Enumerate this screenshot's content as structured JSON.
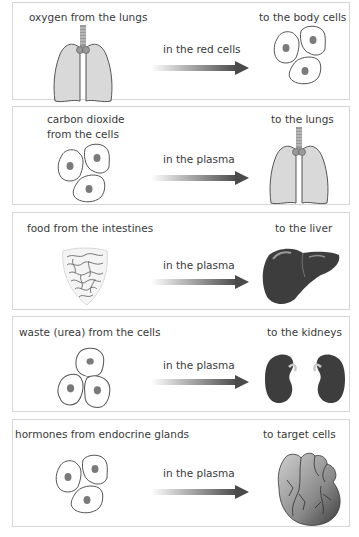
{
  "diagram": {
    "colors": {
      "panel_border": "#d6d6d6",
      "arrow_dark": "#555555",
      "lung_fill": "#d9d9d9",
      "organ_dark": "#3d3d3d",
      "cell_nucleus": "#7a7a7a"
    },
    "rows": [
      {
        "source": "oxygen from the lungs",
        "source_icon": "lungs-icon",
        "carrier": "in the red cells",
        "destination": "to the body cells",
        "destination_icon": "body-cells-icon"
      },
      {
        "source": "carbon dioxide from the cells",
        "source_line1": "carbon dioxide",
        "source_line2": "from the cells",
        "source_icon": "body-cells-icon",
        "carrier": "in the plasma",
        "destination": "to the lungs",
        "destination_icon": "lungs-icon"
      },
      {
        "source": "food from the intestines",
        "source_icon": "intestines-icon",
        "carrier": "in the plasma",
        "destination": "to the liver",
        "destination_icon": "liver-icon"
      },
      {
        "source": "waste (urea) from the cells",
        "source_icon": "body-cells-icon",
        "carrier": "in the plasma",
        "destination": "to the kidneys",
        "destination_icon": "kidneys-icon"
      },
      {
        "source": "hormones from endocrine glands",
        "source_icon": "body-cells-icon",
        "carrier": "in the plasma",
        "destination": "to target cells",
        "destination_icon": "heart-icon"
      }
    ]
  }
}
